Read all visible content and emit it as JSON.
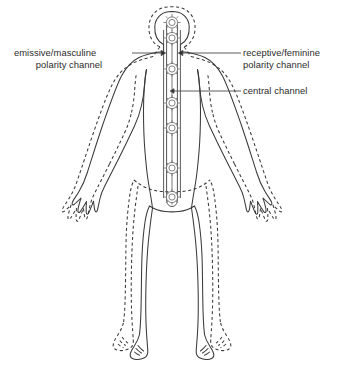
{
  "diagram": {
    "colors": {
      "outline": "#3a3a3a",
      "aura_dashed": "#3a3a3a",
      "channel": "#555555",
      "chakra": "#6b6b6b",
      "text": "#2b2b2b",
      "background": "#ffffff",
      "leader": "#4a4a4a"
    },
    "labels": {
      "left": {
        "line1": "emissive/masculine",
        "line2": "polarity channel"
      },
      "right_top": {
        "line1": "receptive/feminine",
        "line2": "polarity channel"
      },
      "right_bottom": {
        "line1": "central channel"
      }
    },
    "icons": {
      "crown_rosette": "rosette-icon",
      "chakra_rosette": "chakra-rosette-icon",
      "leader_arrow": "arrowhead-icon"
    },
    "chakra_count": 7,
    "leader_lines": 3
  }
}
